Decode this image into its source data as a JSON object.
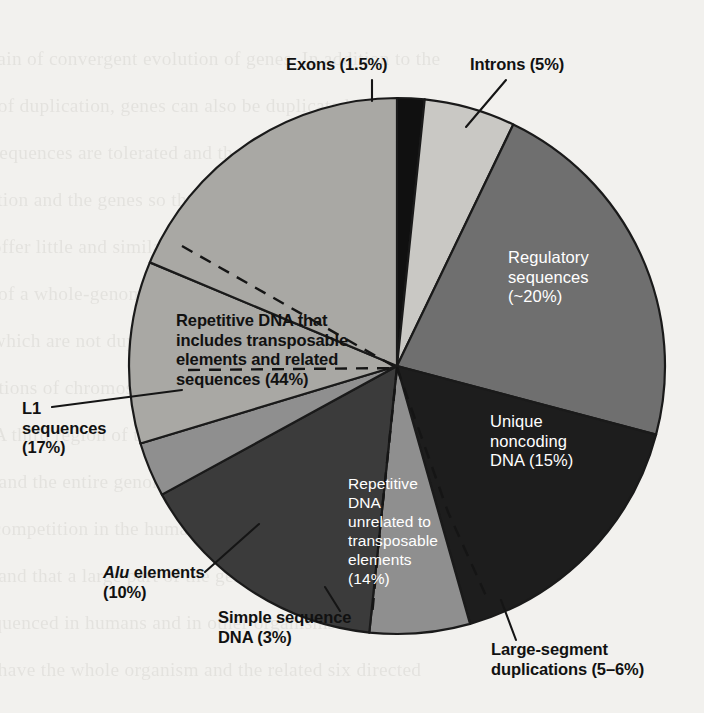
{
  "figure": {
    "kind": "pie-chart",
    "caption_text": "",
    "background_color": "#f2f1ee",
    "outline_color": "#1a1a1a"
  },
  "chart_data": {
    "type": "pie",
    "title": "",
    "xlabel": "",
    "ylabel": "",
    "legend_position": "none",
    "grid": false,
    "total_percent": 100,
    "start_angle_deg": -90,
    "direction": "clockwise",
    "center_px": [
      397,
      366
    ],
    "radius_px": 268,
    "categories": [
      "Exons (1.5%)",
      "Introns (5%)",
      "Regulatory sequences (~20%)",
      "Unique noncoding DNA (15%)",
      "Large-segment duplications (5-6%)",
      "Repetitive DNA unrelated to transposable elements (14%)",
      "Simple sequence DNA (3%)",
      "Alu elements (10%)",
      "L1 sequences (17%)"
    ],
    "values": [
      1.5,
      5,
      20,
      15,
      5.5,
      14,
      3,
      10,
      17
    ],
    "slices": [
      {
        "key": "exons",
        "label": "Exons (1.5%)",
        "value": 1.5,
        "color": "#101010",
        "label_position": "outside",
        "label_lines": [
          "Exons (1.5%)"
        ]
      },
      {
        "key": "introns",
        "label": "Introns (5%)",
        "value": 5,
        "color": "#c9c8c4",
        "label_position": "outside",
        "label_lines": [
          "Introns (5%)"
        ]
      },
      {
        "key": "regulatory",
        "label": "Regulatory sequences (~20%)",
        "value": 20,
        "color": "#6f6f6f",
        "label_position": "inside",
        "label_lines": [
          "Regulatory",
          "sequences",
          "(~20%)"
        ]
      },
      {
        "key": "unique-noncoding",
        "label": "Unique noncoding DNA (15%)",
        "value": 15,
        "color": "#1d1d1d",
        "label_position": "inside",
        "label_lines": [
          "Unique",
          "noncoding",
          "DNA (15%)"
        ]
      },
      {
        "key": "large-segment-duplications",
        "label": "Large-segment duplications (5-6%)",
        "value": 5.5,
        "color": "#8f8f8f",
        "label_position": "outside",
        "label_lines": [
          "Large-segment",
          "duplications (5–6%)"
        ]
      },
      {
        "key": "repetitive-unrelated",
        "label": "Repetitive DNA unrelated to transposable elements (14%)",
        "value": 14,
        "color": "#3b3b3b",
        "label_position": "inside",
        "label_lines": [
          "Repetitive",
          "DNA",
          "unrelated to",
          "transposable",
          "elements",
          "(14%)"
        ]
      },
      {
        "key": "simple-sequence",
        "label": "Simple sequence DNA (3%)",
        "value": 3,
        "color": "#8f8f8f",
        "label_position": "outside",
        "label_lines": [
          "Simple sequence",
          "DNA (3%)"
        ]
      },
      {
        "key": "alu-elements",
        "label": "Alu elements (10%)",
        "value": 10,
        "color": "#a9a8a4",
        "label_position": "outside",
        "label_lines": [
          "Alu elements",
          "(10%)"
        ]
      },
      {
        "key": "l1-sequences",
        "label": "L1 sequences (17%)",
        "value": 17,
        "color": "#a9a8a4",
        "label_position": "outside",
        "label_lines": [
          "L1",
          "sequences",
          "(17%)"
        ]
      }
    ],
    "bracket_annotation": {
      "key": "repetitive-transposable",
      "label": "Repetitive DNA that includes transposable elements and related sequences (44%)",
      "value": 44,
      "style": "dashed",
      "label_lines": [
        "Repetitive DNA that",
        "includes transposable",
        "elements and related",
        "sequences (44%)"
      ]
    }
  },
  "labels": {
    "exons": "Exons (1.5%)",
    "introns": "Introns (5%)",
    "regulatory": "Regulatory\nsequences\n(~20%)",
    "unique_noncoding": "Unique\nnoncoding\nDNA (15%)",
    "repetitive_44_line1": "Repetitive DNA that",
    "repetitive_44_line2": "includes transposable",
    "repetitive_44_line3": "elements and related",
    "repetitive_44_line4": "sequences (44%)",
    "repetitive_44": "Repetitive DNA that\nincludes transposable\nelements and related\nsequences (44%)",
    "l1_sequences": "L1\nsequences\n(17%)",
    "alu_elements_italic": "Alu",
    "alu_elements_rest": " elements\n(10%)",
    "simple_sequence": "Simple sequence\nDNA (3%)",
    "large_segment": "Large-segment\nduplications (5–6%)",
    "repetitive_14": "Repetitive\nDNA\nunrelated to\ntransposable\nelements\n(14%)"
  },
  "ghost_text": {
    "note": "faint show-through of printed text on the reverse of the page",
    "lines": [
      "tain of convergent evolution of genes. In addition to the",
      "of duplication, genes can also be duplicated or the may",
      "sequences are tolerated and the genes are contained in the",
      "tion and the genes so that they appear in which both elements",
      "offer little and similar function but also able to sever",
      "of a whole-genome and the gene sequence. In the",
      "which are not duplicated, but the genes in it over the",
      "tions of chromosomal segments are relatively",
      "A third region of the genome is also",
      "and the entire genome to be relatively more",
      "competition in the human genome, there is a",
      "and that a large part of the genome the eye trans",
      "quenced in humans and in other organisms that",
      "have the whole organism and the related six directed"
    ]
  }
}
